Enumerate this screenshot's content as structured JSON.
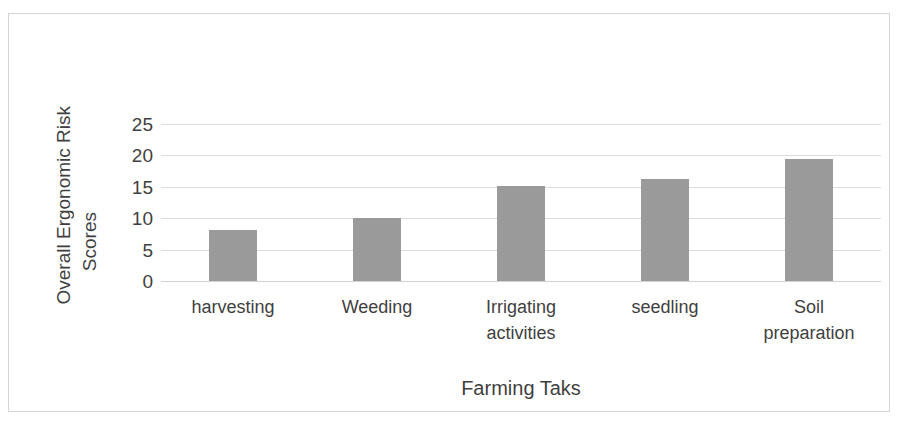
{
  "chart_data": {
    "type": "bar",
    "title": "",
    "categories": [
      "harvesting",
      "Weeding",
      "Irrigating activities",
      "seedling",
      "Soil preparation"
    ],
    "values": [
      8.1,
      10.0,
      15.1,
      16.3,
      19.5
    ],
    "series": [
      {
        "name": "Overall Ergonomic Risk Scores",
        "values": [
          8.1,
          10.0,
          15.1,
          16.3,
          19.5
        ]
      }
    ],
    "xlabel": "Farming Taks",
    "ylabel": "Overall Ergonomic Risk Scores",
    "ylabel_line1": "Overall Ergonomic Risk",
    "ylabel_line2": "Scores",
    "yticks": [
      0,
      5,
      10,
      15,
      20,
      25
    ],
    "ytick_labels": [
      "0",
      "5",
      "10",
      "15",
      "20",
      "25"
    ],
    "ylim": [
      0,
      25
    ],
    "grid": "horizontal",
    "legend": "none",
    "bar_color": "#9a9a9a",
    "gridline_color": "#dcdcdc",
    "frame_color": "#d5d5d5",
    "text_color": "#3f3f3f",
    "background": "#ffffff"
  },
  "labels": {
    "cat_0_line1": "harvesting",
    "cat_0_line2": "",
    "cat_1_line1": "Weeding",
    "cat_1_line2": "",
    "cat_2_line1": "Irrigating",
    "cat_2_line2": "activities",
    "cat_3_line1": "seedling",
    "cat_3_line2": "",
    "cat_4_line1": "Soil",
    "cat_4_line2": "preparation"
  }
}
